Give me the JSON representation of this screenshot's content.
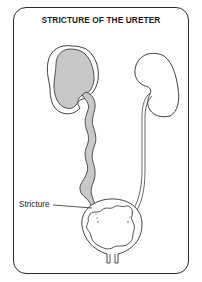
{
  "diagram": {
    "title": "STRICTURE OF THE URETER",
    "labels": {
      "stricture": "Stricture"
    },
    "structures": [
      {
        "name": "right-kidney",
        "state": "enlarged, shaded (hydronephrosis)"
      },
      {
        "name": "right-ureter",
        "state": "dilated, tortuous, shaded"
      },
      {
        "name": "left-kidney",
        "state": "normal, outline"
      },
      {
        "name": "left-ureter",
        "state": "normal, thin double line"
      },
      {
        "name": "bladder",
        "state": "outline with wavy inner wall"
      },
      {
        "name": "urethra",
        "state": "outline"
      }
    ],
    "colors": {
      "outline": "#2a2a2a",
      "shaded": "#c8c8c8",
      "background": "#ffffff"
    }
  }
}
